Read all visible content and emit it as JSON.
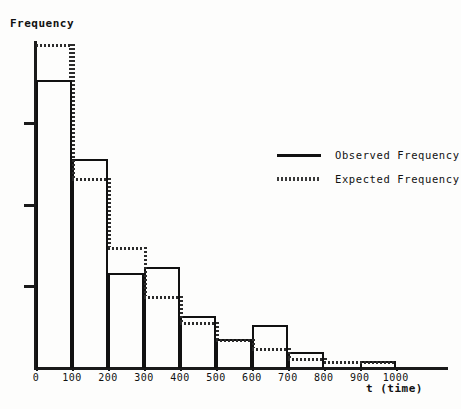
{
  "chart_data": {
    "type": "bar",
    "title": "",
    "subtitle": "",
    "xlabel": "t (time)",
    "ylabel": "Frequency",
    "xlim": [
      0,
      1000
    ],
    "ylim": [
      0,
      100
    ],
    "grid": false,
    "legend_position": "right-middle",
    "bin_width": 100,
    "categories": [
      "0-100",
      "100-200",
      "200-300",
      "300-400",
      "400-500",
      "500-600",
      "600-700",
      "700-800",
      "800-900",
      "900-1000"
    ],
    "x_tick_labels": [
      "0",
      "100",
      "200",
      "300",
      "400",
      "500",
      "600",
      "700",
      "800",
      "900",
      "1000"
    ],
    "x_tick_values": [
      0,
      100,
      200,
      300,
      400,
      500,
      600,
      700,
      800,
      900,
      1000
    ],
    "y_tick_labels": [
      "",
      "",
      ""
    ],
    "y_tick_values": [
      25,
      50,
      75
    ],
    "series": [
      {
        "name": "Observed Frequency",
        "style": "solid",
        "color": "#111111",
        "values": [
          88,
          64,
          29,
          31,
          16,
          9,
          13,
          5,
          0,
          2
        ]
      },
      {
        "name": "Expected Frequency",
        "style": "dotted",
        "color": "#2b2b2b",
        "values": [
          99,
          58,
          37,
          22,
          14,
          9,
          6,
          3,
          2,
          2
        ]
      }
    ]
  },
  "axes": {
    "y_label": "Frequency",
    "x_label": "t (time)",
    "x_tick_labels": [
      "0",
      "100",
      "200",
      "300",
      "400",
      "500",
      "600",
      "700",
      "800",
      "900",
      "1000"
    ]
  },
  "legend": {
    "entries": [
      {
        "label": "Observed Frequency",
        "style": "solid"
      },
      {
        "label": "Expected Frequency",
        "style": "dotted"
      }
    ]
  }
}
